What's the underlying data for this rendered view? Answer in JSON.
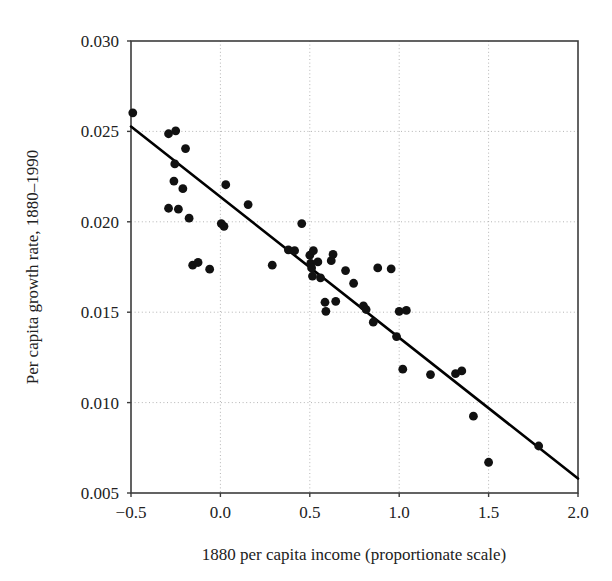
{
  "chart_data": {
    "type": "scatter",
    "title": "",
    "xlabel": "1880 per capita income (proportionate scale)",
    "ylabel": "Per capita growth rate, 1880–1990",
    "xlim": [
      -0.5,
      2.0
    ],
    "ylim": [
      0.005,
      0.03
    ],
    "xticks": [
      -0.5,
      0.0,
      0.5,
      1.0,
      1.5,
      2.0
    ],
    "yticks": [
      0.005,
      0.01,
      0.015,
      0.02,
      0.025,
      0.03
    ],
    "xtick_labels": [
      "−0.5",
      "0.0",
      "0.5",
      "1.0",
      "1.5",
      "2.0"
    ],
    "ytick_labels": [
      "0.005",
      "0.010",
      "0.015",
      "0.020",
      "0.025",
      "0.030"
    ],
    "grid": true,
    "legend": "none",
    "marker": "filled-circle",
    "marker_color": "#111111",
    "fit_line": {
      "label": "regression line",
      "color": "#000000",
      "x_start": -0.5,
      "y_start": 0.02527,
      "x_end": 2.0,
      "y_end": 0.0058,
      "slope": -0.00779,
      "intercept": 0.02138
    },
    "points": [
      {
        "x": -0.49,
        "y": 0.02603
      },
      {
        "x": -0.29,
        "y": 0.02487
      },
      {
        "x": -0.29,
        "y": 0.02075
      },
      {
        "x": -0.25,
        "y": 0.02503
      },
      {
        "x": -0.255,
        "y": 0.0232
      },
      {
        "x": -0.26,
        "y": 0.02225
      },
      {
        "x": -0.235,
        "y": 0.0207
      },
      {
        "x": -0.21,
        "y": 0.02183
      },
      {
        "x": -0.195,
        "y": 0.02405
      },
      {
        "x": -0.175,
        "y": 0.0202
      },
      {
        "x": -0.155,
        "y": 0.0176
      },
      {
        "x": -0.125,
        "y": 0.01775
      },
      {
        "x": -0.06,
        "y": 0.01738
      },
      {
        "x": 0.005,
        "y": 0.0199
      },
      {
        "x": 0.02,
        "y": 0.01975
      },
      {
        "x": 0.03,
        "y": 0.02205
      },
      {
        "x": 0.155,
        "y": 0.02095
      },
      {
        "x": 0.29,
        "y": 0.0176
      },
      {
        "x": 0.38,
        "y": 0.01845
      },
      {
        "x": 0.415,
        "y": 0.0184
      },
      {
        "x": 0.455,
        "y": 0.0199
      },
      {
        "x": 0.5,
        "y": 0.01815
      },
      {
        "x": 0.505,
        "y": 0.0177
      },
      {
        "x": 0.51,
        "y": 0.01745
      },
      {
        "x": 0.515,
        "y": 0.017
      },
      {
        "x": 0.52,
        "y": 0.0184
      },
      {
        "x": 0.545,
        "y": 0.01778
      },
      {
        "x": 0.56,
        "y": 0.0169
      },
      {
        "x": 0.585,
        "y": 0.01555
      },
      {
        "x": 0.59,
        "y": 0.01505
      },
      {
        "x": 0.62,
        "y": 0.01785
      },
      {
        "x": 0.63,
        "y": 0.0182
      },
      {
        "x": 0.645,
        "y": 0.0156
      },
      {
        "x": 0.7,
        "y": 0.0173
      },
      {
        "x": 0.745,
        "y": 0.0166
      },
      {
        "x": 0.8,
        "y": 0.01535
      },
      {
        "x": 0.815,
        "y": 0.01515
      },
      {
        "x": 0.855,
        "y": 0.01445
      },
      {
        "x": 0.88,
        "y": 0.01745
      },
      {
        "x": 0.955,
        "y": 0.0174
      },
      {
        "x": 0.985,
        "y": 0.01365
      },
      {
        "x": 1.0,
        "y": 0.01505
      },
      {
        "x": 1.04,
        "y": 0.0151
      },
      {
        "x": 1.02,
        "y": 0.01185
      },
      {
        "x": 1.175,
        "y": 0.01155
      },
      {
        "x": 1.315,
        "y": 0.0116
      },
      {
        "x": 1.35,
        "y": 0.01175
      },
      {
        "x": 1.415,
        "y": 0.00925
      },
      {
        "x": 1.5,
        "y": 0.0067
      },
      {
        "x": 1.78,
        "y": 0.0076
      }
    ]
  },
  "axis_geometry": {
    "left_px": 131,
    "right_px": 578,
    "top_px": 41,
    "bottom_px": 493
  }
}
